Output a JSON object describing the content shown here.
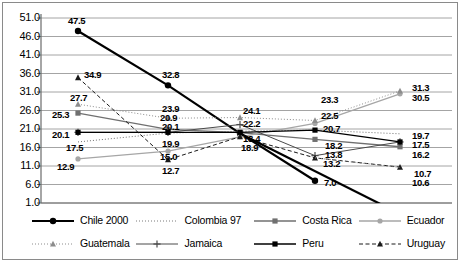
{
  "chart_data": {
    "type": "line",
    "title": "",
    "xlabel": "",
    "ylabel": "",
    "ylim": [
      1.0,
      51.0
    ],
    "ytick_step": 5.0,
    "yticks": [
      "51.0",
      "46.0",
      "41.0",
      "36.0",
      "31.0",
      "26.0",
      "21.0",
      "16.0",
      "11.0",
      "6.0",
      "1.0"
    ],
    "grid": "horizontal",
    "legend_position": "bottom",
    "x": [
      1,
      2,
      3,
      4,
      5
    ],
    "xtick_labels": [
      "",
      "",
      "",
      "",
      ""
    ],
    "series": [
      {
        "name": "Chile 2000",
        "marker": "circle",
        "line": "solid",
        "color": "#000000",
        "weight": "thick",
        "values": [
          47.5,
          32.8,
          19.8,
          7.0,
          null
        ]
      },
      {
        "name": "Colombia 97",
        "marker": "none",
        "line": "dotted",
        "color": "#6f6f6f",
        "weight": "thin",
        "values": [
          17.5,
          19.9,
          20.4,
          20.7,
          19.7
        ]
      },
      {
        "name": "Costa Rica",
        "marker": "square",
        "line": "solid",
        "color": "#707070",
        "weight": "medium",
        "values": [
          25.3,
          20.9,
          20.0,
          18.2,
          16.2
        ]
      },
      {
        "name": "Ecuador",
        "marker": "circle",
        "line": "solid",
        "color": "#a6a6a6",
        "weight": "medium",
        "values": [
          12.9,
          15.0,
          18.9,
          22.5,
          30.5
        ]
      },
      {
        "name": "Guatemala",
        "marker": "triangle",
        "line": "dotted",
        "color": "#8c8c8c",
        "weight": "thin",
        "values": [
          27.7,
          23.9,
          24.1,
          23.3,
          31.3
        ]
      },
      {
        "name": "Jamaica",
        "marker": "plus",
        "line": "solid",
        "color": "#4a4a4a",
        "weight": "thin",
        "values": [
          20.1,
          20.1,
          22.2,
          13.8,
          17.5
        ]
      },
      {
        "name": "Peru",
        "marker": "square",
        "line": "solid",
        "color": "#000000",
        "weight": "medium",
        "values": [
          20.1,
          20.1,
          20.1,
          20.7,
          17.5
        ]
      },
      {
        "name": "Uruguay",
        "marker": "triangle",
        "line": "dashed",
        "color": "#1a1a1a",
        "weight": "thin",
        "values": [
          34.9,
          12.7,
          18.9,
          13.2,
          10.7
        ]
      }
    ],
    "extra_segments": [
      {
        "name": "chile-tail",
        "color": "#000000",
        "note": "Chile line continues below plot area after x=4"
      },
      {
        "name": "uruguay-lower",
        "color": "#8c8c8c",
        "values": [
          null,
          null,
          null,
          null,
          10.6
        ]
      }
    ],
    "point_labels": [
      {
        "text": "47.5",
        "x": 68,
        "y": 16
      },
      {
        "text": "34.9",
        "x": 84,
        "y": 70
      },
      {
        "text": "27.7",
        "x": 70,
        "y": 93
      },
      {
        "text": "25.3",
        "x": 52,
        "y": 110
      },
      {
        "text": "20.1",
        "x": 52,
        "y": 130
      },
      {
        "text": "17.5",
        "x": 66,
        "y": 143
      },
      {
        "text": "12.9",
        "x": 57,
        "y": 162
      },
      {
        "text": "32.8",
        "x": 162,
        "y": 70
      },
      {
        "text": "23.9",
        "x": 162,
        "y": 104
      },
      {
        "text": "20.9",
        "x": 160,
        "y": 113
      },
      {
        "text": "20.1",
        "x": 162,
        "y": 122
      },
      {
        "text": "19.9",
        "x": 162,
        "y": 139
      },
      {
        "text": "15.0",
        "x": 160,
        "y": 152
      },
      {
        "text": "12.7",
        "x": 162,
        "y": 166
      },
      {
        "text": "24.1",
        "x": 243,
        "y": 106
      },
      {
        "text": "22.2",
        "x": 243,
        "y": 119
      },
      {
        "text": "18.4",
        "x": 243,
        "y": 134
      },
      {
        "text": "18.9",
        "x": 241,
        "y": 143
      },
      {
        "text": "23.3",
        "x": 321,
        "y": 95
      },
      {
        "text": "22.5",
        "x": 321,
        "y": 111
      },
      {
        "text": "20.7",
        "x": 323,
        "y": 124
      },
      {
        "text": "18.2",
        "x": 325,
        "y": 141
      },
      {
        "text": "13.8",
        "x": 325,
        "y": 150
      },
      {
        "text": "13.2",
        "x": 323,
        "y": 159
      },
      {
        "text": "7.0",
        "x": 324,
        "y": 178
      },
      {
        "text": "31.3",
        "x": 412,
        "y": 83
      },
      {
        "text": "30.5",
        "x": 412,
        "y": 93
      },
      {
        "text": "19.7",
        "x": 412,
        "y": 131
      },
      {
        "text": "17.5",
        "x": 412,
        "y": 140
      },
      {
        "text": "16.2",
        "x": 412,
        "y": 150
      },
      {
        "text": "10.7",
        "x": 414,
        "y": 169
      },
      {
        "text": "10.6",
        "x": 412,
        "y": 178
      }
    ]
  },
  "legend": {
    "rows": [
      [
        {
          "label": "Chile 2000",
          "marker": "circle",
          "line": "solid",
          "color": "#000000",
          "weight": "thick"
        },
        {
          "label": "Colombia 97",
          "marker": "none",
          "line": "dotted",
          "color": "#7a7a7a",
          "weight": "thin"
        },
        {
          "label": "Costa Rica",
          "marker": "square",
          "line": "solid",
          "color": "#707070",
          "weight": "medium"
        },
        {
          "label": "Ecuador",
          "marker": "circle",
          "line": "solid",
          "color": "#a6a6a6",
          "weight": "medium"
        }
      ],
      [
        {
          "label": "Guatemala",
          "marker": "triangle",
          "line": "dotted",
          "color": "#8c8c8c",
          "weight": "thin"
        },
        {
          "label": "Jamaica",
          "marker": "plus",
          "line": "solid",
          "color": "#4a4a4a",
          "weight": "thin"
        },
        {
          "label": "Peru",
          "marker": "square",
          "line": "solid",
          "color": "#000000",
          "weight": "medium"
        },
        {
          "label": "Uruguay",
          "marker": "triangle",
          "line": "dashed",
          "color": "#1a1a1a",
          "weight": "thin"
        }
      ]
    ]
  },
  "colors": {
    "axis": "#6b6b6b",
    "grid": "#9a9a9a",
    "border": "#8a8a8a",
    "background": "#ffffff",
    "text": "#000000"
  }
}
